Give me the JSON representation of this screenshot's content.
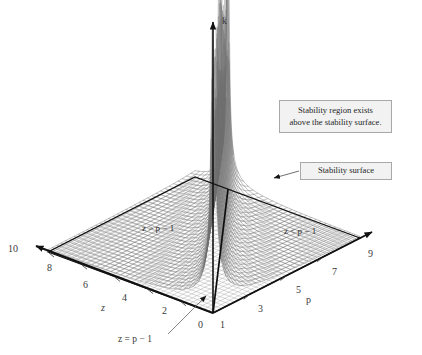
{
  "figure": {
    "background_color": "#ffffff",
    "width": 422,
    "height": 355
  },
  "axes": {
    "vertical": {
      "name": "k",
      "label": "k"
    },
    "left": {
      "name": "z",
      "label": "z",
      "ticks": [
        "10",
        "8",
        "6",
        "4",
        "2",
        "0"
      ],
      "range": [
        0,
        10
      ]
    },
    "right": {
      "name": "p",
      "label": "p",
      "ticks": [
        "1",
        "3",
        "5",
        "7",
        "9"
      ],
      "range": [
        1,
        9
      ]
    }
  },
  "annotations": {
    "region_left": "z > p − 1",
    "region_right": "z < p − 1",
    "singular_line": "z = p − 1",
    "callout_region": "Stability region exists\nabove the stability surface.",
    "callout_surface": "Stability surface"
  },
  "colors": {
    "axis": "#121212",
    "mesh_base": "#8d8d8d",
    "mesh_surface": "#7c7c7c",
    "callout_fill": "#f2f2f2",
    "callout_border": "#a8a8a8",
    "text": "#3a3a3a"
  },
  "chart_data": {
    "type": "surface",
    "title": "",
    "xlabel": "p",
    "ylabel": "z",
    "zlabel": "k",
    "xlim": [
      1,
      9
    ],
    "ylim": [
      0,
      10
    ],
    "zlim": [
      0,
      1
    ],
    "grid": true,
    "legend_position": "none",
    "annotation_lines": [
      {
        "text": "z = p − 1",
        "kind": "curve-label"
      },
      {
        "text": "z > p − 1",
        "kind": "region-label"
      },
      {
        "text": "z < p − 1",
        "kind": "region-label"
      }
    ],
    "tick_labels": {
      "p": [
        "1",
        "3",
        "5",
        "7",
        "9"
      ],
      "z": [
        "0",
        "2",
        "4",
        "6",
        "8",
        "10"
      ]
    }
  }
}
